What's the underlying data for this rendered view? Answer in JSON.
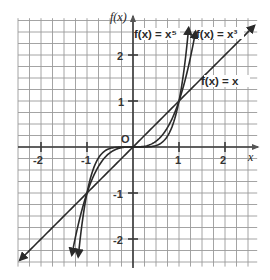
{
  "chart_data": {
    "type": "line",
    "title": "",
    "xlabel": "x",
    "ylabel": "f(x)",
    "origin_label": "O",
    "xlim": [
      -2.5,
      2.7
    ],
    "ylim": [
      -2.6,
      2.8
    ],
    "grid": true,
    "grid_step": 0.25,
    "x_ticks": [
      -2,
      -1,
      1,
      2
    ],
    "x_tick_labels": [
      "-2",
      "-1",
      "1",
      "2"
    ],
    "y_ticks": [
      2,
      1,
      -1,
      -2
    ],
    "y_tick_labels": [
      "2",
      "1",
      "-1",
      "-2"
    ],
    "series": [
      {
        "name": "f(x) = x",
        "label": "f(x) = x",
        "exponent": 1,
        "x": [
          -2.46,
          -1,
          0,
          1,
          2.64
        ],
        "values": [
          -2.46,
          -1,
          0,
          1,
          2.64
        ]
      },
      {
        "name": "f(x) = x^3",
        "label": "f(x) = x³",
        "exponent": 3,
        "x": [
          -1.33,
          -1,
          -0.5,
          0,
          0.5,
          1,
          1.36
        ],
        "values": [
          -2.35,
          -1,
          -0.125,
          0,
          0.125,
          1,
          2.52
        ]
      },
      {
        "name": "f(x) = x^5",
        "label": "f(x) = x⁵",
        "exponent": 5,
        "x": [
          -1.19,
          -1,
          -0.5,
          0,
          0.5,
          1,
          1.21
        ],
        "values": [
          -2.38,
          -1,
          -0.031,
          0,
          0.031,
          1,
          2.59
        ]
      }
    ],
    "intersections": [
      [
        -1,
        -1
      ],
      [
        0,
        0
      ],
      [
        1,
        1
      ]
    ],
    "legend_position": "inline labels near curves",
    "line_color": "#2a2a2a",
    "grid_color": "#9a9a9a"
  },
  "labels": {
    "y_axis": "f(x)",
    "x_axis": "x",
    "origin": "O",
    "curve_x5": "f(x) = x⁵",
    "curve_x3": "f(x) = x³",
    "curve_x": "f(x) = x",
    "tick_x_neg2": "-2",
    "tick_x_neg1": "-1",
    "tick_x_1": "1",
    "tick_x_2": "2",
    "tick_y_2": "2",
    "tick_y_1": "1",
    "tick_y_neg1": "-1",
    "tick_y_neg2": "-2"
  }
}
